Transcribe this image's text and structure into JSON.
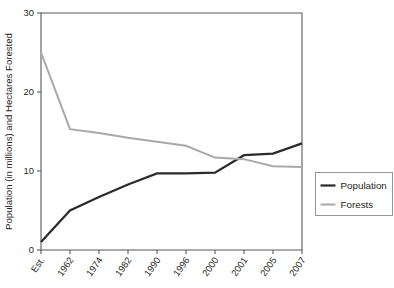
{
  "chart_data": {
    "type": "line",
    "title": "",
    "xlabel": "",
    "ylabel": "Population (in millions) and Hectares Forested",
    "categories": [
      "Est.",
      "1962",
      "1974",
      "1982",
      "1990",
      "1996",
      "2000",
      "2001",
      "2005",
      "2007"
    ],
    "ylim": [
      0,
      30
    ],
    "yticks": [
      0,
      10,
      20,
      30
    ],
    "ytick_labels": [
      "0",
      "10",
      "20",
      "30"
    ],
    "grid": false,
    "legend_position": "right",
    "series": [
      {
        "name": "Population",
        "color": "#2b2b2b",
        "width": 2.2,
        "values": [
          1.0,
          5.0,
          6.7,
          8.3,
          9.7,
          9.7,
          9.8,
          12.0,
          12.2,
          13.5
        ]
      },
      {
        "name": "Forests",
        "color": "#a7a9ac",
        "width": 2.0,
        "values": [
          25.0,
          15.3,
          14.8,
          14.2,
          13.7,
          13.2,
          11.7,
          11.5,
          10.6,
          10.5
        ]
      }
    ]
  },
  "legend": {
    "items": [
      {
        "label": "Population"
      },
      {
        "label": "Forests"
      }
    ]
  },
  "axes": {
    "y_title": "Population (in millions) and Hectares Forested"
  }
}
